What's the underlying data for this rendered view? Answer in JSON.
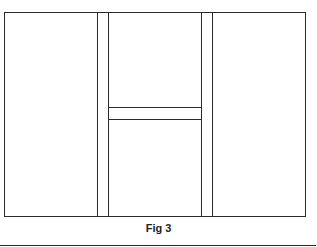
{
  "figure": {
    "caption": "Fig 3",
    "line_color": "#2a2a2a"
  }
}
